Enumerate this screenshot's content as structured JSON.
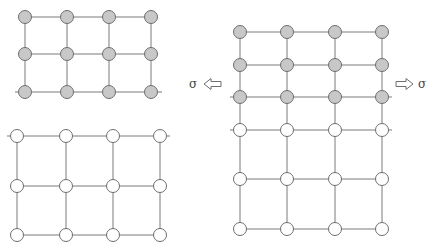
{
  "diagram": {
    "colors": {
      "line": "#7a7a7a",
      "node_stroke": "#6e6e6e",
      "node_filled": "#c8c8c8",
      "node_empty": "#ffffff",
      "arrow": "#6e6e6e",
      "text": "#444444"
    },
    "node_radius": 6.5,
    "lattices": [
      {
        "name": "top-left-lattice-surface",
        "xs": [
          25,
          67,
          109,
          151
        ],
        "ys": [
          17,
          54,
          92
        ],
        "filled_rows": [
          0,
          1,
          2
        ],
        "extend_row": 2,
        "extend_left": 10,
        "extend_right": 11
      },
      {
        "name": "bottom-left-lattice-bulk",
        "xs": [
          17,
          66,
          113,
          160
        ],
        "ys": [
          136,
          186,
          235
        ],
        "filled_rows": [],
        "extend_row": 0,
        "extend_left": 10,
        "extend_right": 10
      },
      {
        "name": "right-lattice-strained",
        "xs": [
          240,
          287,
          335,
          382
        ],
        "ys": [
          32,
          65,
          97,
          130,
          179,
          229
        ],
        "filled_rows": [
          0,
          1,
          2
        ],
        "extend_rows": [
          2,
          3
        ],
        "extend_left": 10,
        "extend_right": 10
      }
    ],
    "stress_left": {
      "symbol": "σ",
      "direction": "left",
      "x": 197,
      "y": 84
    },
    "stress_right": {
      "symbol": "σ",
      "direction": "right",
      "x": 398,
      "y": 84
    }
  }
}
